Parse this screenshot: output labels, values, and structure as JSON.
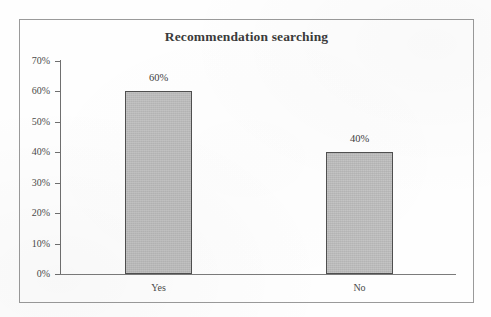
{
  "figure": {
    "background_color": "#fefefe",
    "frame_color": "#9a9a9a",
    "axis_color": "#6f6f6f",
    "bar_fill_color": "#b9b9b9",
    "bar_border_color": "#4f4f4f",
    "text_color": "#4a4a4a"
  },
  "chart_data": {
    "type": "bar",
    "title": "Recommendation searching",
    "xlabel": "",
    "ylabel": "",
    "categories": [
      "Yes",
      "No"
    ],
    "values": [
      60,
      40
    ],
    "value_labels": [
      "60%",
      "40%"
    ],
    "ylim": [
      0,
      70
    ],
    "ytick_values": [
      70,
      60,
      50,
      40,
      30,
      20,
      10,
      0
    ],
    "ytick_labels": [
      "70%",
      "60%",
      "50%",
      "40%",
      "30%",
      "20%",
      "10%",
      "0%"
    ],
    "grid": false,
    "legend": null,
    "legend_position": "none",
    "series": [
      {
        "name": "Recommendation searching",
        "values": [
          60,
          40
        ]
      }
    ],
    "annotations": []
  }
}
